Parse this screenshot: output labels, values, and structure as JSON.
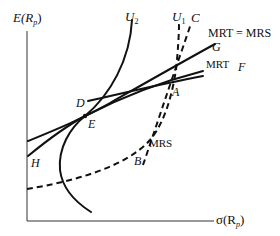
{
  "axes": {
    "y_label_main": "E(R",
    "y_label_sub": "p",
    "y_label_close": ")",
    "x_label_main": "σ(R",
    "x_label_sub": "p",
    "x_label_close": ")"
  },
  "curves": {
    "U2": {
      "main": "U",
      "sub": "2"
    },
    "U1": {
      "main": "U",
      "sub": "1"
    },
    "C": "C",
    "G": "G",
    "F": "F",
    "MRT_eq_MRS": "MRT = MRS",
    "MRT": "MRT",
    "MRS": "MRS"
  },
  "points": {
    "A": "A",
    "B": "B",
    "D": "D",
    "E": "E",
    "H": "H"
  }
}
